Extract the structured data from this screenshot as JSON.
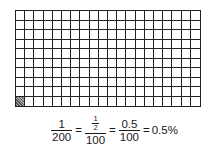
{
  "grid": {
    "columns": 20,
    "rows": 10,
    "total_squares": 200,
    "shaded_squares": [
      {
        "row": 10,
        "column": 1
      }
    ],
    "line_color": "#222222",
    "shade_color": "#777777"
  },
  "formula": {
    "frac1": {
      "num": "1",
      "den": "200"
    },
    "eq1": "=",
    "frac2": {
      "num": "1/2",
      "num_top": "1",
      "num_bottom": "2",
      "den": "100"
    },
    "eq2": "=",
    "frac3": {
      "num": "0.5",
      "den": "100"
    },
    "eq3": "=",
    "result": "0.5%"
  }
}
